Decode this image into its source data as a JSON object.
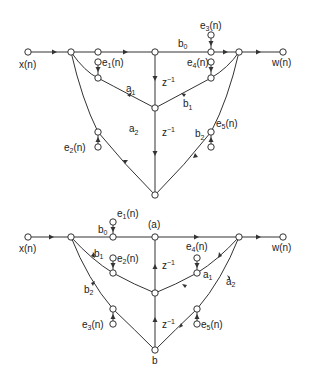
{
  "diagrams": [
    {
      "caption": "(a)",
      "input_label": "x(n)",
      "output_label": "w(n)",
      "coefficients": {
        "b0": "b0",
        "b1": "b1",
        "b2": "b2",
        "a1": "a1",
        "a2": "a2"
      },
      "delay_label": "z⁻¹",
      "noise_sources": [
        "e1(n)",
        "e2(n)",
        "e3(n)",
        "e4(n)",
        "e5(n)"
      ],
      "labels": {
        "x": "x(n)",
        "w": "w(n)",
        "b0": "b",
        "b0s": "0",
        "a1": "a",
        "a1s": "1",
        "a2": "a",
        "a2s": "2",
        "b1": "b",
        "b1s": "1",
        "b2": "b",
        "b2s": "2",
        "z1": "z",
        "z1s": "−1",
        "z2": "z",
        "z2s": "−1",
        "e1": "e",
        "e1s": "1",
        "e1t": "(n)",
        "e2": "e",
        "e2s": "2",
        "e2t": "(n)",
        "e3": "e",
        "e3s": "3",
        "e3t": "(n)",
        "e4": "e",
        "e4s": "4",
        "e4t": "(n)",
        "e5": "e",
        "e5s": "5",
        "e5t": "(n)"
      }
    },
    {
      "caption": "b",
      "input_label": "x(n)",
      "output_label": "w(n)",
      "labels": {
        "x": "x(n)",
        "w": "w(n)",
        "b0": "b",
        "b0s": "0",
        "b1": "b",
        "b1s": "1",
        "b2": "b",
        "b2s": "2",
        "a1": "a",
        "a1s": "1",
        "a2": "a",
        "a2s": "2",
        "z1": "z",
        "z1s": "−1",
        "z2": "z",
        "z2s": "−1",
        "e1": "e",
        "e1s": "1",
        "e1t": "(n)",
        "e2": "e",
        "e2s": "2",
        "e2t": "(n)",
        "e3": "e",
        "e3s": "3",
        "e3t": "(n)",
        "e4": "e",
        "e4s": "4",
        "e4t": "(n)",
        "e5": "e",
        "e5s": "5",
        "e5t": "(n)"
      }
    }
  ]
}
